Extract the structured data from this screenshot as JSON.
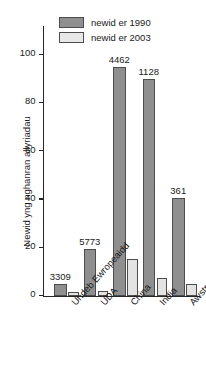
{
  "chart_data": {
    "type": "bar",
    "title": "",
    "xlabel": "",
    "ylabel": "Newid yng nghanran allyriadau",
    "ylim": [
      0,
      112
    ],
    "yticks": [
      0,
      20,
      40,
      60,
      80,
      100
    ],
    "ytick_labels": [
      "0",
      "20",
      "40",
      "60",
      "80",
      "100"
    ],
    "grid": false,
    "legend_position": "top-left",
    "categories": [
      "Undeb Ewropeaidd",
      "UDA",
      "China",
      "India",
      "Awstralia"
    ],
    "series": [
      {
        "name": "newid er 1990",
        "color": "#8f8f8f",
        "values": [
          5,
          19.5,
          95,
          90,
          40.5
        ]
      },
      {
        "name": "newid er 2003",
        "color": "#e3e3e3",
        "values": [
          1.5,
          2,
          15.5,
          7.5,
          5
        ]
      }
    ],
    "annotations": [
      {
        "category": "Undeb Ewropeaidd",
        "text": "3309"
      },
      {
        "category": "UDA",
        "text": "5773"
      },
      {
        "category": "China",
        "text": "4462"
      },
      {
        "category": "India",
        "text": "1128"
      },
      {
        "category": "Awstralia",
        "text": "361"
      }
    ]
  }
}
